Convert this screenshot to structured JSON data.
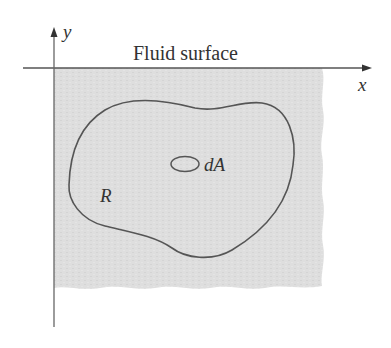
{
  "figure": {
    "surface_label": "Fluid surface",
    "x_axis_label": "x",
    "y_axis_label": "y",
    "region_label": "R",
    "element_label": "dA"
  },
  "colors": {
    "fluid": "#dcdcdc",
    "line": "#555555",
    "text": "#333333",
    "background": "#ffffff"
  }
}
